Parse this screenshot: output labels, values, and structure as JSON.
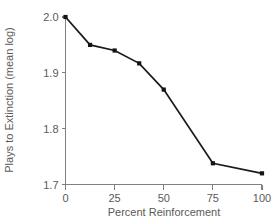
{
  "chart_data": {
    "type": "line",
    "title": "",
    "xlabel": "Percent Reinforcement",
    "ylabel": "Plays to Extinction (mean log)",
    "x": [
      0,
      12.5,
      25,
      37.5,
      50,
      75,
      100
    ],
    "values": [
      2.0,
      1.95,
      1.94,
      1.917,
      1.87,
      1.738,
      1.72
    ],
    "series": [
      {
        "name": "Plays to Extinction",
        "values": [
          2.0,
          1.95,
          1.94,
          1.917,
          1.87,
          1.738,
          1.72
        ]
      }
    ],
    "xlim": [
      0,
      100
    ],
    "ylim": [
      1.7,
      2.0
    ],
    "xticks": [
      0,
      25,
      50,
      75,
      100
    ],
    "xtick_labels": [
      "0",
      "25",
      "50",
      "75",
      "100"
    ],
    "yticks": [
      1.7,
      1.8,
      1.9,
      2.0
    ],
    "ytick_labels": [
      "1.7",
      "1.8",
      "1.9",
      "2.0"
    ],
    "grid": false,
    "legend": null,
    "marker": "square",
    "line_color": "#1a1a1a",
    "marker_color": "#141414",
    "axis_color": "#808080",
    "text_color": "#5a5a5a",
    "background": "#ffffff"
  }
}
